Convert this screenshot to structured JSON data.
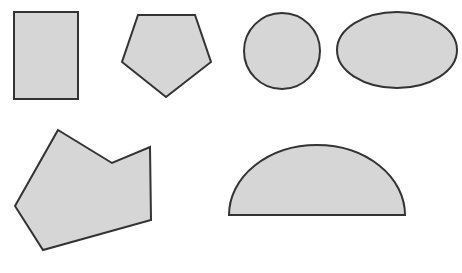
{
  "figure": {
    "title": "",
    "background_color": "#ffffff",
    "width": 462,
    "height": 273,
    "shape_fill_color": "#d6d6d6",
    "shape_stroke_color": "#333333",
    "shape_stroke_width": 2,
    "shape_count": 6,
    "rows": [
      {
        "row_label": "",
        "shapes": [
          "rectangle",
          "pentagon",
          "circle",
          "ellipse"
        ]
      },
      {
        "row_label": "",
        "shapes": [
          "concave-polygon",
          "semicircle"
        ]
      }
    ],
    "shapes": [
      {
        "name": "rectangle",
        "kind": "rect",
        "x": 14,
        "y": 12,
        "width": 64,
        "height": 87
      },
      {
        "name": "pentagon",
        "kind": "polygon",
        "points": "138,15 195,15 211,62 166,97 122,62"
      },
      {
        "name": "circle",
        "kind": "ellipse",
        "cx": 282,
        "cy": 51,
        "rx": 38,
        "ry": 38
      },
      {
        "name": "ellipse",
        "kind": "ellipse",
        "cx": 397,
        "cy": 50,
        "rx": 60,
        "ry": 38
      },
      {
        "name": "concave-polygon",
        "kind": "polygon",
        "points": "58,130 112,163 150,147 151,220 43,250 15,206"
      },
      {
        "name": "semicircle",
        "kind": "path",
        "d": "M 229,215 A 88,70 0 0 1 405,215 Z"
      }
    ]
  }
}
